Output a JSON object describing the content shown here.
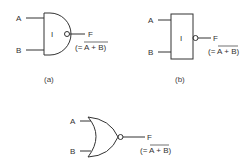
{
  "diagram": {
    "gates": [
      {
        "id": "a",
        "shape": "and-shaped",
        "inputs": [
          "A",
          "B"
        ],
        "inner_label": "I",
        "output": "F",
        "expression": "(= A + B)",
        "expression_overbar": "A + B",
        "caption": "(a)"
      },
      {
        "id": "b",
        "shape": "rectangle",
        "inputs": [
          "A",
          "B"
        ],
        "inner_label": "I",
        "output": "F",
        "expression": "(= A + B)",
        "expression_overbar": "A + B",
        "caption": "(b)"
      },
      {
        "id": "c",
        "shape": "or-shaped (NOR)",
        "inputs": [
          "A",
          "B"
        ],
        "output": "F",
        "expression": "(= A + B)",
        "expression_overbar": "A + B",
        "caption": ""
      }
    ]
  }
}
